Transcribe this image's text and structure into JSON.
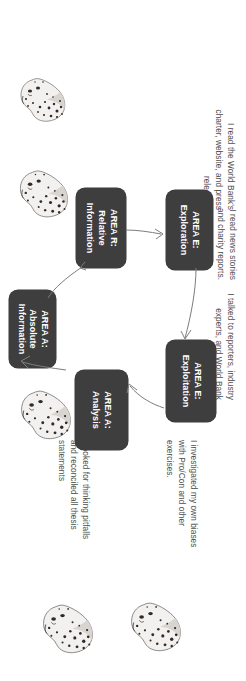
{
  "diagram": {
    "title_present": false,
    "background_color": "#ffffff",
    "node_fill_color": "#3e3e3e",
    "node_text_color": "#ffffff",
    "caption_text_color": "#4d4d4d",
    "arrow_color": "#7d7d7d",
    "orientation_note": "rotated-90-degrees",
    "nodes": [
      {
        "id": "area-a-absolute-information",
        "line1": "AREA A:",
        "line2": "Absolute",
        "line3": "Information"
      },
      {
        "id": "area-r-relative-information",
        "line1": "AREA R:",
        "line2": "Relative",
        "line3": "Information"
      },
      {
        "id": "area-e-exploration",
        "line1": "AREA E:",
        "line2": "Exploration",
        "line3": ""
      },
      {
        "id": "area-e-exploitation",
        "line1": "AREA E:",
        "line2": "Exploitation",
        "line3": ""
      },
      {
        "id": "area-a-analysis",
        "line1": "AREA A:",
        "line2": "Analysis",
        "line3": ""
      }
    ],
    "captions": [
      {
        "id": "caption-absolute-information",
        "text": "I read the World Bank's\ncharter, website, and press\nreleases."
      },
      {
        "id": "caption-relative-information",
        "text": "I read news stories\nand charity reports."
      },
      {
        "id": "caption-exploration",
        "text": "I talked to reporters, industry\nexperts, and World Bank\nemployees."
      },
      {
        "id": "caption-exploitation",
        "text": "I investigated my own biases\nwith Pro/Con and other\nexercises."
      },
      {
        "id": "caption-analysis",
        "text": "I looked for thinking pitfalls\nand reconciled all thesis\nstatements"
      }
    ],
    "images": [
      {
        "id": "leopard-head-1"
      },
      {
        "id": "leopard-head-2"
      },
      {
        "id": "leopard-head-3"
      },
      {
        "id": "leopard-head-4"
      },
      {
        "id": "leopard-head-5"
      }
    ]
  }
}
